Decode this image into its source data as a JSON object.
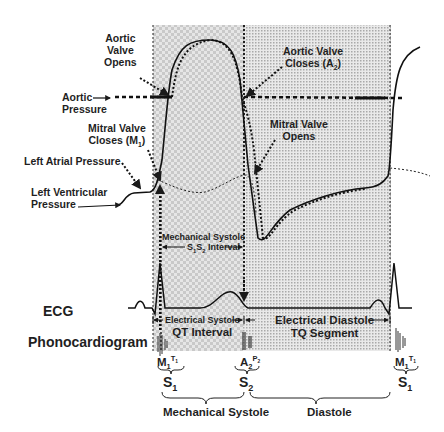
{
  "diagram": {
    "type": "cardiac-cycle-wiggers-diagram",
    "colors": {
      "ink": "#1a1a1a",
      "systole_shade": "#d9d9d9",
      "diastole_shade": "#cfcfcf",
      "background": "#ffffff"
    },
    "labels": {
      "aortic_valve_opens": [
        "Aortic",
        "Valve",
        "Opens"
      ],
      "aortic_pressure": [
        "Aortic",
        "Pressure"
      ],
      "mitral_valve_closes": [
        "Mitral Valve",
        "Closes (M",
        "1",
        ")"
      ],
      "left_atrial_pressure": "Left Atrial Pressure",
      "left_ventricular_pressure": [
        "Left Ventricular",
        "Pressure"
      ],
      "aortic_valve_closes": [
        "Aortic Valve",
        "Closes (A",
        "2",
        ")"
      ],
      "mitral_valve_opens": [
        "Mitral Valve",
        "Opens"
      ],
      "mechanical_systole_interval": [
        "Mechanical Systole",
        "S",
        "1",
        "S",
        "2",
        " Interval"
      ],
      "ecg": "ECG",
      "phonocardiogram": "Phonocardiogram",
      "electrical_systole": [
        "Electrical Systole",
        "QT Interval"
      ],
      "electrical_diastole": [
        "Electrical Diastole",
        "TQ Segment"
      ],
      "heart_sounds": {
        "s1_components": [
          "M",
          "1",
          "T",
          "1"
        ],
        "s2_components": [
          "A",
          "2",
          "P",
          "2"
        ],
        "s1": [
          "S",
          "1"
        ],
        "s2": [
          "S",
          "2"
        ]
      },
      "mechanical_systole": "Mechanical Systole",
      "diastole": "Diastole"
    }
  }
}
